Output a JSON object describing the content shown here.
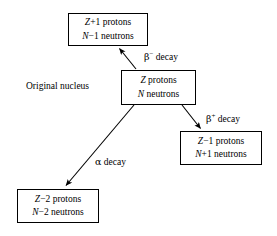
{
  "diagram": {
    "background_color": "#ffffff",
    "line_color": "#000000",
    "nodes": {
      "beta_minus_daughter": {
        "line1_symbol": "Z",
        "line1_rest": "+1 protons",
        "line2_symbol": "N",
        "line2_rest": "−1 neutrons"
      },
      "parent": {
        "line1_symbol": "Z",
        "line1_rest": " protons",
        "line2_symbol": "N",
        "line2_rest": " neutrons"
      },
      "beta_plus_daughter": {
        "line1_symbol": "Z",
        "line1_rest": "−1 protons",
        "line2_symbol": "N",
        "line2_rest": "+1 neutrons"
      },
      "alpha_daughter": {
        "line1_symbol": "Z",
        "line1_rest": "−2 protons",
        "line2_symbol": "N",
        "line2_rest": "−2 neutrons"
      }
    },
    "labels": {
      "original_nucleus": "Original nucleus",
      "beta_minus_decay_symbol": "β",
      "beta_minus_decay_sup": "−",
      "beta_minus_decay_text": " decay",
      "beta_plus_decay_symbol": "β",
      "beta_plus_decay_sup": "+",
      "beta_plus_decay_text": " decay",
      "alpha_decay_symbol": "α",
      "alpha_decay_text": " decay"
    }
  }
}
